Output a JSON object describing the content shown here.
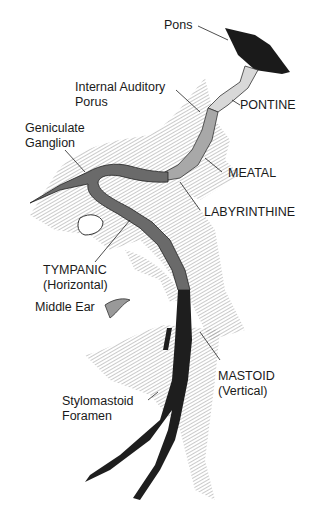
{
  "labels": {
    "pons": "Pons",
    "internal_auditory_porus": [
      "Internal Auditory",
      "Porus"
    ],
    "pontine": "PONTINE",
    "geniculate_ganglion": [
      "Geniculate",
      "Ganglion"
    ],
    "meatal": "MEATAL",
    "labyrinthine": "LABYRINTHINE",
    "tympanic": [
      "TYMPANIC",
      "(Horizontal)"
    ],
    "middle_ear": "Middle Ear",
    "mastoid": [
      "MASTOID",
      "(Vertical)"
    ],
    "stylomastoid_foramen": [
      "Stylomastoid",
      "Foramen"
    ]
  },
  "colors": {
    "pons": "#1a1a1a",
    "pontine_segment": "#d8d8d8",
    "meatal_segment": "#a8a8a8",
    "labyrinthine_tympanic_segment": "#6a6a6a",
    "mastoid_segment": "#1e1e1e",
    "bone_hatch": "#9a9a9a"
  }
}
